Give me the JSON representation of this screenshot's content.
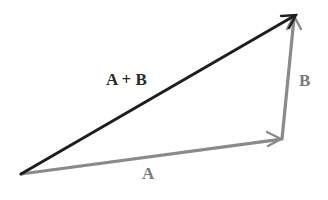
{
  "diagram": {
    "type": "vector-addition",
    "vectors": [
      {
        "id": "A",
        "label": "A",
        "from": [
          21,
          174
        ],
        "to": [
          282,
          139
        ],
        "color": "#8a8a8a"
      },
      {
        "id": "B",
        "label": "B",
        "from": [
          282,
          139
        ],
        "to": [
          294,
          16
        ],
        "color": "#8a8a8a"
      },
      {
        "id": "A+B",
        "label": "A + B",
        "from": [
          21,
          174
        ],
        "to": [
          296,
          15
        ],
        "color": "#1e1e1e"
      }
    ]
  },
  "labels": {
    "sum": "A + B",
    "b": "B",
    "a": "A"
  }
}
